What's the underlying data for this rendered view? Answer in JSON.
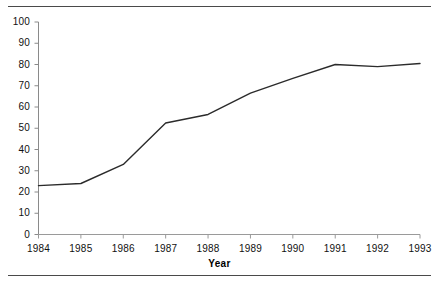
{
  "figure": {
    "background_color": "#ffffff",
    "line_color": "#2b2b2b",
    "axis_color": "#7a7a7a",
    "rule_color": "#4a4a4a",
    "top_rule": "",
    "bottom_rule": ""
  },
  "chart_data": {
    "type": "line",
    "title": "",
    "xlabel": "Year",
    "ylabel": "",
    "categories": [
      "1984",
      "1985",
      "1986",
      "1987",
      "1988",
      "1989",
      "1990",
      "1991",
      "1992",
      "1993"
    ],
    "x": [
      1984,
      1985,
      1986,
      1987,
      1988,
      1989,
      1990,
      1991,
      1992,
      1993
    ],
    "values": [
      23,
      24,
      33,
      52.5,
      56.5,
      66.5,
      73.5,
      80,
      79,
      80.5
    ],
    "series": [
      {
        "name": "",
        "values": [
          23,
          24,
          33,
          52.5,
          56.5,
          66.5,
          73.5,
          80,
          79,
          80.5
        ]
      }
    ],
    "ylim": [
      0,
      100
    ],
    "ytick_labels": [
      "0",
      "10",
      "20",
      "30",
      "40",
      "50",
      "60",
      "70",
      "80",
      "90",
      "100"
    ],
    "ytick_values": [
      0,
      10,
      20,
      30,
      40,
      50,
      60,
      70,
      80,
      90,
      100
    ],
    "xtick_labels": [
      "1984",
      "1985",
      "1986",
      "1987",
      "1988",
      "1989",
      "1990",
      "1991",
      "1992",
      "1993"
    ],
    "grid": false,
    "legend": false,
    "legend_position": "none",
    "markers": false
  }
}
